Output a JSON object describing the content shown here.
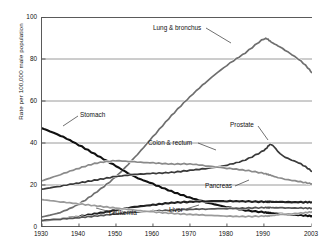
{
  "chart_data": {
    "type": "line",
    "title": "",
    "xlabel": "",
    "ylabel": "Rate per 100,000 male population",
    "xlim": [
      1930,
      2003
    ],
    "ylim": [
      0,
      100
    ],
    "grid": true,
    "grid_axis": "y",
    "legend_position": "inline-annotations",
    "xticks": [
      "1930",
      "1940",
      "1950",
      "1960",
      "1970",
      "1980",
      "1990",
      "2003"
    ],
    "xtick_values": [
      1930,
      1940,
      1950,
      1960,
      1970,
      1980,
      1990,
      2003
    ],
    "yticks": [
      "0",
      "20",
      "40",
      "60",
      "80",
      "100"
    ],
    "ytick_values": [
      0,
      20,
      40,
      60,
      80,
      100
    ],
    "x": [
      1930,
      1935,
      1940,
      1945,
      1950,
      1955,
      1960,
      1965,
      1970,
      1975,
      1980,
      1985,
      1990,
      1992,
      1995,
      2000,
      2003
    ],
    "series": [
      {
        "name": "Lung & bronchus",
        "label": "Lung & bronchus",
        "color": "#6e6e6e",
        "values": [
          4.8,
          7.0,
          11.0,
          17.0,
          24.0,
          33.0,
          43.0,
          53.0,
          62.0,
          70.0,
          77.0,
          83.0,
          89.5,
          88.0,
          85.0,
          79.0,
          73.5
        ]
      },
      {
        "name": "Stomach",
        "label": "Stomach",
        "color": "#111111",
        "values": [
          47.0,
          43.5,
          39.0,
          34.0,
          29.0,
          24.0,
          20.5,
          17.0,
          14.0,
          11.5,
          9.5,
          8.0,
          7.0,
          6.6,
          6.2,
          5.6,
          5.2
        ]
      },
      {
        "name": "Prostate",
        "label": "Prostate",
        "color": "#3a3a3a",
        "values": [
          18.0,
          19.5,
          21.0,
          22.5,
          24.0,
          25.0,
          25.5,
          26.0,
          27.0,
          28.0,
          29.5,
          32.0,
          36.5,
          39.2,
          34.0,
          30.0,
          26.5
        ]
      },
      {
        "name": "Colon & rectum",
        "label": "Colon & rectum",
        "color": "#8a8a8a",
        "values": [
          22.0,
          25.0,
          28.0,
          30.5,
          31.5,
          31.0,
          30.5,
          30.0,
          30.0,
          29.0,
          28.0,
          27.0,
          25.5,
          24.5,
          23.0,
          21.5,
          20.5
        ]
      },
      {
        "name": "Pancreas",
        "label": "Pancreas",
        "color": "#222222",
        "values": [
          3.0,
          3.8,
          5.0,
          6.5,
          8.0,
          9.5,
          10.5,
          11.5,
          12.0,
          12.3,
          12.3,
          12.2,
          12.0,
          12.0,
          11.9,
          11.8,
          11.8
        ]
      },
      {
        "name": "Leukemia",
        "label": "Leukemia",
        "color": "#555555",
        "values": [
          3.2,
          3.8,
          4.5,
          5.3,
          6.2,
          7.0,
          7.6,
          8.0,
          8.4,
          8.6,
          8.8,
          9.0,
          9.2,
          9.2,
          9.1,
          9.0,
          8.9
        ]
      },
      {
        "name": "Liver",
        "label": "Liver",
        "color": "#9a9a9a",
        "values": [
          13.0,
          12.0,
          11.0,
          10.0,
          9.0,
          8.0,
          7.2,
          6.5,
          6.0,
          5.6,
          5.2,
          5.0,
          5.2,
          5.4,
          6.0,
          6.6,
          7.2
        ]
      }
    ],
    "annotations": [
      {
        "text": "Lung & bronchus",
        "x": 153,
        "y": 25
      },
      {
        "text": "Stomach",
        "x": 80,
        "y": 112
      },
      {
        "text": "Prostate",
        "x": 230,
        "y": 122
      },
      {
        "text": "Colon & rectum",
        "x": 148,
        "y": 140
      },
      {
        "text": "Pancreas",
        "x": 205,
        "y": 183
      },
      {
        "text": "Leukemia",
        "x": 109,
        "y": 210
      },
      {
        "text": "Liver",
        "x": 169,
        "y": 207
      }
    ]
  }
}
